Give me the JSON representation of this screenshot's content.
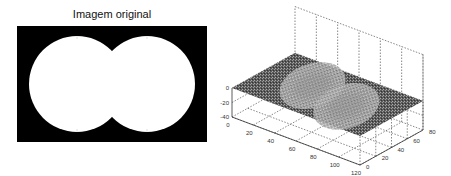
{
  "figure": {
    "left_title": "Imagem original",
    "colors": {
      "background": "#ffffff",
      "image_black": "#000000",
      "image_white": "#ffffff",
      "axis": "#333333",
      "grid": "#555555",
      "surface_dark": "#4a4a4a",
      "surface_light": "#c8c8c8"
    }
  },
  "chart_data": [
    {
      "type": "heatmap",
      "title": "Imagem original",
      "description": "Binary image: two overlapping white discs on black background",
      "shapes": [
        {
          "kind": "disc",
          "center_frac": [
            0.31,
            0.5
          ],
          "radius_frac_of_height": 0.5
        },
        {
          "kind": "disc",
          "center_frac": [
            0.69,
            0.5
          ],
          "radius_frac_of_height": 0.5
        }
      ],
      "xlabel": "",
      "ylabel": ""
    },
    {
      "type": "surface",
      "title": "",
      "description": "3D mesh surface with a figure-eight shaped depression (two overlapping bowls), noisy texture",
      "x_ticks": [
        "0",
        "20",
        "40",
        "60",
        "80",
        "100",
        "120"
      ],
      "y_ticks": [
        "0",
        "20",
        "40",
        "60",
        "80"
      ],
      "z_ticks": [
        "0",
        "-20",
        "-40"
      ],
      "xlim": [
        0,
        120
      ],
      "ylim": [
        0,
        80
      ],
      "zlim": [
        -40,
        0
      ],
      "grid": true
    }
  ]
}
